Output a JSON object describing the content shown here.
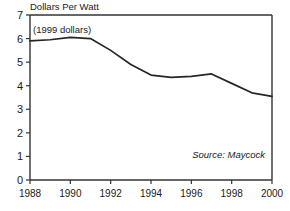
{
  "chart_data": {
    "type": "line",
    "title": "Dollars Per Watt",
    "subtitle": "(1999 dollars)",
    "annotation": "Source: Maycock",
    "xlabel": "",
    "ylabel": "Dollars Per Watt",
    "xlim": [
      1988,
      2000
    ],
    "ylim": [
      0,
      7
    ],
    "grid": false,
    "legend": "none",
    "x": [
      1988,
      1989,
      1990,
      1991,
      1992,
      1993,
      1994,
      1995,
      1996,
      1997,
      1998,
      1999,
      2000
    ],
    "values": [
      5.9,
      5.95,
      6.05,
      6.0,
      5.5,
      4.9,
      4.45,
      4.35,
      4.4,
      4.5,
      4.1,
      3.7,
      3.55
    ],
    "categories": [
      "1988",
      "1989",
      "1990",
      "1991",
      "1992",
      "1993",
      "1994",
      "1995",
      "1996",
      "1997",
      "1998",
      "1999",
      "2000"
    ],
    "xticks": [
      "1988",
      "1990",
      "1992",
      "1994",
      "1996",
      "1998",
      "2000"
    ],
    "xtick_values": [
      1988,
      1990,
      1992,
      1994,
      1996,
      1998,
      2000
    ],
    "yticks": [
      "0",
      "1",
      "2",
      "3",
      "4",
      "5",
      "6",
      "7"
    ],
    "ytick_values": [
      0,
      1,
      2,
      3,
      4,
      5,
      6,
      7
    ],
    "line_color": "#262626",
    "axis_color": "#333333",
    "background_color": "#ffffff"
  }
}
